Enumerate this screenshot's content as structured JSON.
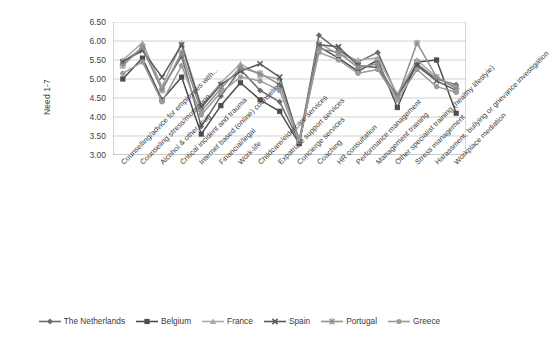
{
  "chart_data": {
    "type": "line",
    "title": "",
    "xlabel": "",
    "ylabel": "Need 1-7",
    "ylim": [
      3.0,
      6.5
    ],
    "ytick_labels": [
      "6.50",
      "6.00",
      "5.50",
      "5.00",
      "4.50",
      "4.00",
      "3.50",
      "3.00"
    ],
    "ytick_values": [
      6.5,
      6.0,
      5.5,
      5.0,
      4.5,
      4.0,
      3.5,
      3.0
    ],
    "grid": true,
    "legend_position": "bottom",
    "categories": [
      "Counselling/advice for employees with...",
      "Counseling stress/motivation",
      "Alcohol & other drug",
      "Critical incident and trauma",
      "Internet based (online) counseling",
      "Financial/legal",
      "Work-life",
      "Childcare/eldercare services",
      "Expatriate support services",
      "Concierge services",
      "Coaching",
      "HR consultation",
      "Performance management",
      "Management training",
      "Other specialist training (healthy lifestyle)",
      "Stress management",
      "Harassment, bullying or grievance investigation",
      "Workplace mediation"
    ],
    "series": [
      {
        "name": "The Netherlands",
        "color": "#6b6b6b",
        "marker": "diamond",
        "values": [
          5.45,
          5.8,
          4.75,
          5.6,
          3.75,
          4.55,
          5.25,
          4.7,
          4.4,
          3.35,
          6.15,
          5.75,
          5.45,
          5.7,
          4.55,
          5.4,
          5.0,
          4.85
        ]
      },
      {
        "name": "Belgium",
        "color": "#4d4d4d",
        "marker": "square",
        "values": [
          5.0,
          5.55,
          4.45,
          5.05,
          3.55,
          4.3,
          4.9,
          4.45,
          4.15,
          3.3,
          5.85,
          5.55,
          5.2,
          5.5,
          4.25,
          5.45,
          5.5,
          4.1
        ]
      },
      {
        "name": "France",
        "color": "#a8a8a8",
        "marker": "triangle",
        "values": [
          5.5,
          5.95,
          4.8,
          5.95,
          4.3,
          4.9,
          5.4,
          5.1,
          5.0,
          3.4,
          5.95,
          5.65,
          5.5,
          5.55,
          4.6,
          5.5,
          5.05,
          4.8
        ]
      },
      {
        "name": "Spain",
        "color": "#5a5a5a",
        "marker": "x",
        "values": [
          5.45,
          5.75,
          5.05,
          5.9,
          4.25,
          4.85,
          5.2,
          5.4,
          5.05,
          3.35,
          5.9,
          5.85,
          5.35,
          5.3,
          4.55,
          5.35,
          4.95,
          4.7
        ]
      },
      {
        "name": "Portugal",
        "color": "#8f8f8f",
        "marker": "star",
        "values": [
          5.35,
          5.85,
          4.7,
          5.7,
          4.15,
          4.75,
          5.3,
          5.15,
          4.85,
          3.4,
          5.8,
          5.7,
          5.3,
          5.4,
          4.5,
          5.95,
          5.05,
          4.75
        ]
      },
      {
        "name": "Greece",
        "color": "#9b9b9b",
        "marker": "circle",
        "values": [
          5.15,
          5.45,
          4.4,
          5.35,
          4.05,
          4.65,
          5.05,
          4.95,
          4.7,
          3.35,
          5.7,
          5.5,
          5.15,
          5.25,
          4.45,
          5.25,
          4.8,
          4.65
        ]
      }
    ]
  },
  "legend": {
    "items": [
      {
        "label": "The Netherlands"
      },
      {
        "label": "Belgium"
      },
      {
        "label": "France"
      },
      {
        "label": "Spain"
      },
      {
        "label": "Portugal"
      },
      {
        "label": "Greece"
      }
    ]
  }
}
